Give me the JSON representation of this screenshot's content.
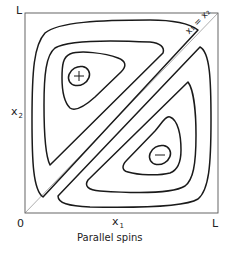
{
  "figure": {
    "caption": "Parallel spins",
    "axes": {
      "origin_label": "0",
      "x_end_label": "L",
      "y_end_label": "L",
      "x_label": "x",
      "x_label_sub": "1",
      "y_label": "x",
      "y_label_sub": "2"
    },
    "diagonal_label": "x₁ = x₂",
    "regions": [
      {
        "name": "upper-left lobe",
        "sign": "+"
      },
      {
        "name": "lower-right lobe",
        "sign": "−"
      }
    ],
    "colors": {
      "line": "#1a1a1a",
      "background": "#ffffff"
    }
  }
}
